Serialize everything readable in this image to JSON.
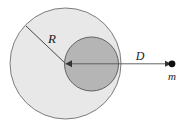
{
  "figure": {
    "title": "Gravitational attraction of a point mass by a sphere with an embedded denser core",
    "background_color": "#ffffff",
    "shapes": {
      "outer_sphere": {
        "name": "outer-sphere",
        "cx": 65.5,
        "cy": 63.5,
        "r": 55.5,
        "fill": "#e8e8e8",
        "stroke": "#6e6e6e",
        "stroke_width": 0.9
      },
      "inner_core": {
        "name": "inner-core",
        "cx": 91.5,
        "cy": 64.0,
        "r": 27.0,
        "fill": "#b5b5b5",
        "stroke": "#555555",
        "stroke_width": 0.9
      },
      "radius_line": {
        "name": "radius-line",
        "x1": 26.0,
        "y1": 26.0,
        "x2": 65.5,
        "y2": 63.5,
        "stroke": "#333333",
        "stroke_width": 0.9
      },
      "distance_line": {
        "name": "distance-line",
        "x1": 65.5,
        "y1": 63.8,
        "x2": 172.0,
        "y2": 63.8,
        "stroke": "#555555",
        "stroke_width": 0.9
      },
      "point_mass": {
        "name": "point-mass-dot",
        "cx": 172.0,
        "cy": 63.8,
        "r": 3.4,
        "fill": "#111111"
      }
    },
    "labels": {
      "radius": {
        "text": "R",
        "x": 52,
        "y": 43
      },
      "distance": {
        "text": "D",
        "x": 140,
        "y": 60
      },
      "mass": {
        "text": "m",
        "x": 172,
        "y": 80
      }
    },
    "arrowheads": {
      "center_arrow": {
        "name": "center-arrowhead",
        "points": "72,60.3 65.5,63.8 72,67.3"
      },
      "mass_arrow": {
        "name": "mass-arrowhead",
        "points": "165,60.8 171.5,63.8 165,66.8"
      }
    }
  }
}
